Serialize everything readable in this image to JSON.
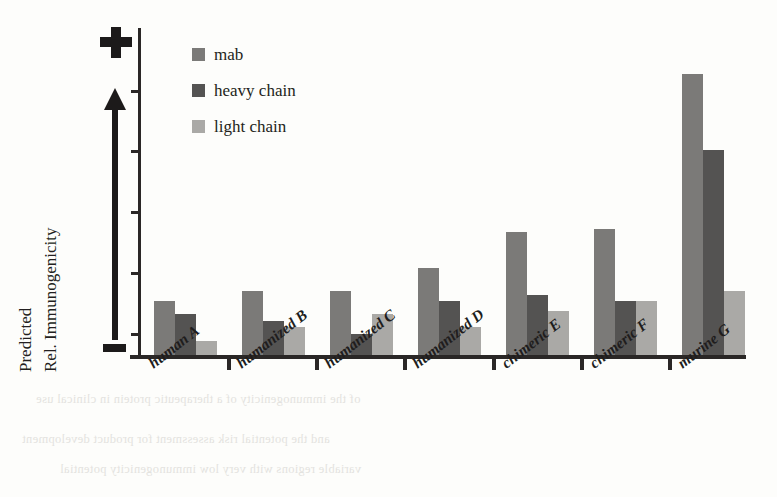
{
  "chart_data": {
    "type": "bar",
    "title": "",
    "xlabel": "",
    "ylabel": "Predicted Rel. Immunogenicity",
    "ylabel_lines": [
      "Predicted",
      "Rel. Immunogenicity"
    ],
    "axis_top_symbol": "+",
    "axis_bottom_symbol": "-",
    "axis_direction_hint": "arrow-up",
    "ylim": [
      0,
      100
    ],
    "y_tick_count": 5,
    "y_tick_labels": [],
    "grid": false,
    "legend_position": "top-left-inside",
    "categories": [
      "human A",
      "humanized B",
      "humanized C",
      "humanized D",
      "chimeric E",
      "chimeric F",
      "murine G"
    ],
    "series": [
      {
        "name": "mab",
        "color": "#7b7a78",
        "values": [
          17,
          20,
          20,
          27,
          38,
          39,
          86
        ]
      },
      {
        "name": "heavy chain",
        "color": "#545352",
        "values": [
          13,
          11,
          7,
          17,
          19,
          17,
          63
        ]
      },
      {
        "name": "light chain",
        "color": "#aaa9a6",
        "values": [
          5,
          9,
          13,
          9,
          14,
          17,
          20
        ]
      }
    ]
  },
  "legend": {
    "items": [
      {
        "label": "mab",
        "color": "#7b7a78"
      },
      {
        "label": "heavy chain",
        "color": "#545352"
      },
      {
        "label": "light chain",
        "color": "#aaa9a6"
      }
    ]
  },
  "axis": {
    "top_symbol": "+",
    "bottom_symbol": "-",
    "title_line_1": "Predicted",
    "title_line_2": "Rel. Immunogenicity"
  },
  "colors": {
    "mab": "#7b7a78",
    "heavy_chain": "#545352",
    "light_chain": "#aaa9a6",
    "axis": "#2a2726",
    "text": "#231f20",
    "background": "#fdfdfb"
  },
  "scan_artifact": {
    "lines": [
      "of the immunogenicity of a therapeutic protein in clinical use",
      "and the potential risk assessment for product development",
      "variable regions with very low immunogenicity potential"
    ]
  }
}
